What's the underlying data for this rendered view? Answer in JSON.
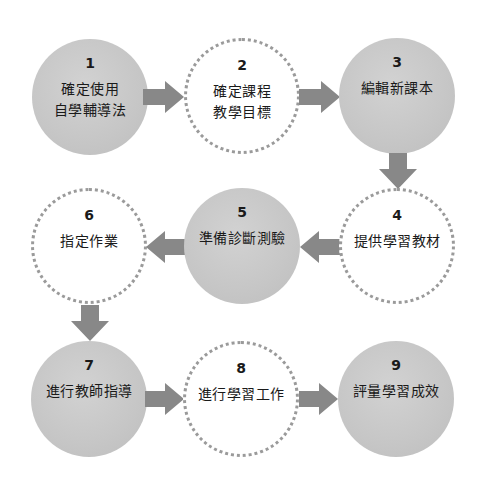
{
  "diagram": {
    "type": "process-flow",
    "colors": {
      "filled": "#c8c8c8",
      "dotted_border": "#9a9a9a",
      "arrow": "#888888"
    },
    "steps": [
      {
        "number": "1",
        "label": "確定使用\n自學輔導法",
        "line1": "確定使用",
        "line2": "自學輔導法",
        "style": "filled"
      },
      {
        "number": "2",
        "label": "確定課程\n教學目標",
        "line1": "確定課程",
        "line2": "教學目標",
        "style": "dotted"
      },
      {
        "number": "3",
        "label": "編輯新課本",
        "line1": "編輯新課本",
        "line2": "",
        "style": "filled"
      },
      {
        "number": "4",
        "label": "提供學習教材",
        "line1": "提供學習教材",
        "line2": "",
        "style": "dotted"
      },
      {
        "number": "5",
        "label": "準備診斷測驗",
        "line1": "準備診斷測驗",
        "line2": "",
        "style": "filled"
      },
      {
        "number": "6",
        "label": "指定作業",
        "line1": "指定作業",
        "line2": "",
        "style": "dotted"
      },
      {
        "number": "7",
        "label": "進行教師指導",
        "line1": "進行教師指導",
        "line2": "",
        "style": "filled"
      },
      {
        "number": "8",
        "label": "進行學習工作",
        "line1": "進行學習工作",
        "line2": "",
        "style": "dotted"
      },
      {
        "number": "9",
        "label": "評量學習成效",
        "line1": "評量學習成效",
        "line2": "",
        "style": "filled"
      }
    ],
    "flow": [
      "1→2",
      "2→3",
      "3→4",
      "4→5",
      "5→6",
      "6→7",
      "7→8",
      "8→9"
    ]
  }
}
